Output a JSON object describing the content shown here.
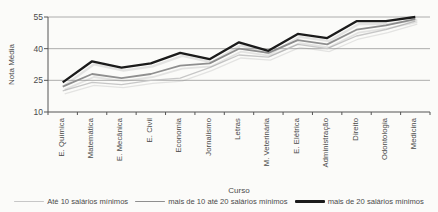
{
  "chart_data": {
    "type": "line",
    "title": "",
    "xlabel": "Curso",
    "ylabel": "Nota Média",
    "categories": [
      "E. Química",
      "Matemática",
      "E. Mecânica",
      "E. Civil",
      "Economia",
      "Jornalismo",
      "Letras",
      "M. Veterinária",
      "E. Elétrica",
      "Administração",
      "Direito",
      "Odontologia",
      "Medicina"
    ],
    "series": [
      {
        "name": "Até 10 salários mínimos",
        "color": "#c7c7c7",
        "width": 1.3,
        "values": [
          20,
          24,
          23,
          25,
          26,
          31,
          37,
          36,
          42,
          40,
          46,
          49,
          53
        ]
      },
      {
        "name": "mais de 10 até 20 salários mínimos",
        "color": "#8f8f8f",
        "width": 1.8,
        "values": [
          22,
          28,
          26,
          28,
          32,
          33,
          40,
          38,
          44,
          42,
          49,
          51,
          54
        ]
      },
      {
        "name": "mais de 20 salários mínimos",
        "color": "#1b1b1b",
        "width": 2.3,
        "values": [
          24,
          34,
          31,
          33,
          38,
          35,
          43,
          39,
          47,
          45,
          53,
          53,
          55
        ]
      }
    ],
    "y_ticks": [
      10,
      25,
      40,
      55
    ],
    "ylim": [
      10,
      55
    ],
    "grid": true,
    "legend_position": "bottom",
    "axis_color": "#555555",
    "grid_color": "#999999"
  }
}
